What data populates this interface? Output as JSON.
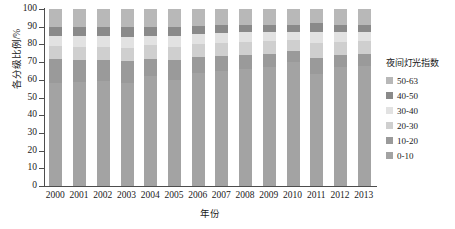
{
  "chart_data": {
    "type": "bar",
    "subtype": "100%-stacked-bar",
    "title": "",
    "xlabel": "年份",
    "ylabel": "各分级比例/%",
    "ylim": [
      0,
      100
    ],
    "yticks": [
      0,
      10,
      20,
      30,
      40,
      50,
      60,
      70,
      80,
      90,
      100
    ],
    "grid": false,
    "legend_position": "right",
    "legend_title": "夜间灯光指数",
    "categories": [
      "2000",
      "2001",
      "2002",
      "2003",
      "2004",
      "2005",
      "2006",
      "2007",
      "2008",
      "2009",
      "2010",
      "2011",
      "2012",
      "2013"
    ],
    "series": [
      {
        "name": "0-10",
        "color": "#a3a3a3",
        "values": [
          58.0,
          59.0,
          59.5,
          58.0,
          62.0,
          60.0,
          64.0,
          65.0,
          66.0,
          67.0,
          70.0,
          63.0,
          67.0,
          68.0
        ]
      },
      {
        "name": "10-20",
        "color": "#9a9a9a",
        "values": [
          13.5,
          12.0,
          11.5,
          12.5,
          10.0,
          11.0,
          9.0,
          8.5,
          8.0,
          7.5,
          6.0,
          9.5,
          7.0,
          6.5
        ]
      },
      {
        "name": "20-30",
        "color": "#cfcfcf",
        "values": [
          7.5,
          7.5,
          7.5,
          7.5,
          7.5,
          7.5,
          7.5,
          7.5,
          7.5,
          7.5,
          6.5,
          8.5,
          7.5,
          7.5
        ]
      },
      {
        "name": "30-40",
        "color": "#e2e2e2",
        "values": [
          6.0,
          6.0,
          6.0,
          6.0,
          5.5,
          6.0,
          5.5,
          5.5,
          5.5,
          5.0,
          4.5,
          6.0,
          5.5,
          5.0
        ]
      },
      {
        "name": "40-50",
        "color": "#8a8a8a",
        "values": [
          5.0,
          5.5,
          5.5,
          6.0,
          5.0,
          5.5,
          4.5,
          4.5,
          4.0,
          4.0,
          4.0,
          5.0,
          4.0,
          4.0
        ]
      },
      {
        "name": "50-63",
        "color": "#b8b8b8",
        "values": [
          10.0,
          10.0,
          10.0,
          10.0,
          10.0,
          10.0,
          9.5,
          9.0,
          9.0,
          9.0,
          9.0,
          8.0,
          9.0,
          9.0
        ]
      }
    ]
  },
  "legend": {
    "title": "夜间灯光指数",
    "items": [
      {
        "label": "50-63",
        "color": "#b8b8b8"
      },
      {
        "label": "40-50",
        "color": "#8a8a8a"
      },
      {
        "label": "30-40",
        "color": "#e2e2e2"
      },
      {
        "label": "20-30",
        "color": "#cfcfcf"
      },
      {
        "label": "10-20",
        "color": "#9a9a9a"
      },
      {
        "label": "0-10",
        "color": "#a3a3a3"
      }
    ]
  },
  "axes": {
    "y_title": "各分级比例/%",
    "x_title": "年份"
  }
}
